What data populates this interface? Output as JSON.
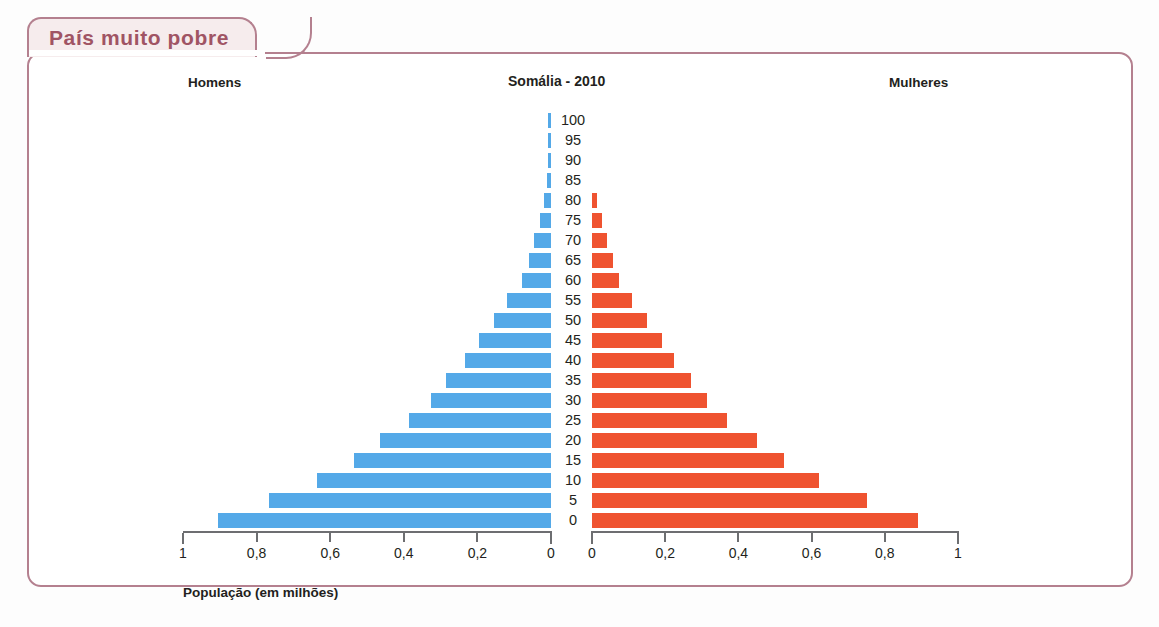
{
  "panel": {
    "tab_label": "País muito pobre",
    "border_color": "#b4808f",
    "tab_fill": "#f6eced",
    "tab_text_color": "#a05464"
  },
  "chart_data": {
    "type": "bar",
    "subtype": "population-pyramid",
    "title": "Somália - 2010",
    "xlabel": "População (em milhões)",
    "ylabel": "",
    "grid": false,
    "legend_position": "top",
    "left_header": "Homens",
    "right_header": "Mulheres",
    "categories": [
      "0",
      "5",
      "10",
      "15",
      "20",
      "25",
      "30",
      "35",
      "40",
      "45",
      "50",
      "55",
      "60",
      "65",
      "70",
      "75",
      "80",
      "85",
      "90",
      "95",
      "100"
    ],
    "axis": {
      "left_ticks": [
        "1",
        "0,8",
        "0,6",
        "0,4",
        "0,2",
        "0"
      ],
      "left_tick_values": [
        1,
        0.8,
        0.6,
        0.4,
        0.2,
        0
      ],
      "right_ticks": [
        "0",
        "0,2",
        "0,4",
        "0,6",
        "0,8",
        "1"
      ],
      "right_tick_values": [
        0,
        0.2,
        0.4,
        0.6,
        0.8,
        1
      ],
      "left_xlim": [
        1,
        0
      ],
      "right_xlim": [
        0,
        1
      ],
      "decimal_separator": ","
    },
    "series": [
      {
        "name": "Homens",
        "side": "left",
        "color": "#54a9e8",
        "values": [
          0.905,
          0.765,
          0.635,
          0.535,
          0.465,
          0.385,
          0.325,
          0.285,
          0.235,
          0.195,
          0.155,
          0.12,
          0.08,
          0.06,
          0.045,
          0.03,
          0.018,
          0.01,
          0.008,
          0.008,
          0.008
        ]
      },
      {
        "name": "Mulheres",
        "side": "right",
        "color": "#ef5330",
        "values": [
          0.89,
          0.75,
          0.62,
          0.525,
          0.45,
          0.37,
          0.315,
          0.27,
          0.225,
          0.19,
          0.15,
          0.11,
          0.075,
          0.058,
          0.042,
          0.026,
          0.014,
          0.0,
          0.0,
          0.0,
          0.0
        ]
      }
    ]
  }
}
